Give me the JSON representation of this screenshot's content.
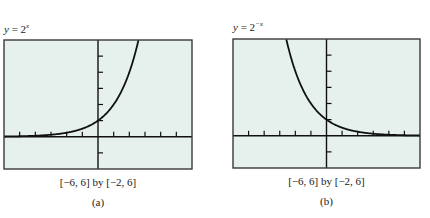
{
  "figures": [
    {
      "id": "a",
      "equation": {
        "lhs": "y",
        "op": "=",
        "base": "2",
        "exponent": "x"
      },
      "window_text": "[−6, 6] by [−2, 6]",
      "sublabel": "(a)"
    },
    {
      "id": "b",
      "equation": {
        "lhs": "y",
        "op": "=",
        "base": "2",
        "exponent": "−x"
      },
      "window_text": "[−6, 6] by [−2, 6]",
      "sublabel": "(b)"
    }
  ],
  "colors": {
    "plot_background": "#e6f1ee",
    "frame": "#3a3a3a",
    "axis": "#111111",
    "curve": "#111111"
  },
  "chart_data": [
    {
      "type": "line",
      "title": "y = 2^x",
      "xlabel": "",
      "ylabel": "",
      "xlim": [
        -6,
        6
      ],
      "ylim": [
        -2,
        6
      ],
      "x_tick_step": 1,
      "y_tick_step": 1,
      "grid": false,
      "legend": false,
      "window": "[-6, 6] by [-2, 6]",
      "sublabel": "(a)",
      "series": [
        {
          "name": "y = 2^x",
          "x": [
            -6,
            -5,
            -4,
            -3,
            -2,
            -1,
            0,
            1,
            2,
            2.585
          ],
          "y": [
            0.016,
            0.031,
            0.063,
            0.125,
            0.25,
            0.5,
            1,
            2,
            4,
            6
          ]
        }
      ]
    },
    {
      "type": "line",
      "title": "y = 2^-x",
      "xlabel": "",
      "ylabel": "",
      "xlim": [
        -6,
        6
      ],
      "ylim": [
        -2,
        6
      ],
      "x_tick_step": 1,
      "y_tick_step": 1,
      "grid": false,
      "legend": false,
      "window": "[-6, 6] by [-2, 6]",
      "sublabel": "(b)",
      "series": [
        {
          "name": "y = 2^-x",
          "x": [
            -2.585,
            -2,
            -1,
            0,
            1,
            2,
            3,
            4,
            5,
            6
          ],
          "y": [
            6,
            4,
            2,
            1,
            0.5,
            0.25,
            0.125,
            0.063,
            0.031,
            0.016
          ]
        }
      ]
    }
  ]
}
